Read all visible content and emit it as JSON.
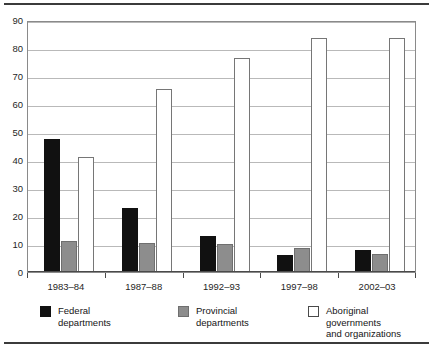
{
  "chart_data": {
    "type": "bar",
    "title": "",
    "subtitle": "",
    "xlabel": "",
    "ylabel": "",
    "categories": [
      "1983–84",
      "1987–88",
      "1992–93",
      "1997–98",
      "2002–03"
    ],
    "series": [
      {
        "name": "Federal departments",
        "color": "#111111",
        "values": [
          47.5,
          23,
          12.8,
          6.2,
          8
        ]
      },
      {
        "name": "Provincial departments",
        "color": "#8d8d8d",
        "values": [
          11.2,
          10.2,
          9.9,
          8.4,
          6.6
        ]
      },
      {
        "name": "Aboriginal governments and organizations",
        "color": "#ffffff",
        "values": [
          41,
          65.5,
          76.3,
          83.7,
          83.5
        ]
      }
    ],
    "ylim": [
      0,
      90
    ],
    "yticks": [
      0,
      10,
      20,
      30,
      40,
      50,
      60,
      70,
      80,
      90
    ],
    "ytick_labels": [
      "0",
      "10",
      "20",
      "30",
      "40",
      "50",
      "60",
      "70",
      "80",
      "90"
    ],
    "grid": true,
    "grid_axis": "y",
    "legend_position": "bottom"
  },
  "legend": {
    "items": [
      {
        "label": "Federal\ndepartments",
        "swatch": "federal-swatch"
      },
      {
        "label": "Provincial\ndepartments",
        "swatch": "provincial-swatch"
      },
      {
        "label": "Aboriginal governments\nand organizations",
        "swatch": "aboriginal-swatch"
      }
    ]
  }
}
